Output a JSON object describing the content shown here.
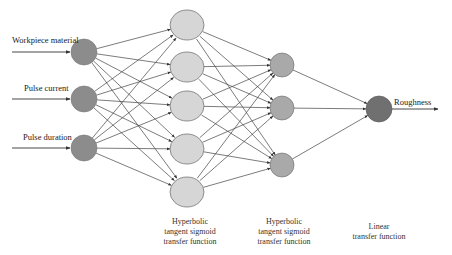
{
  "diagram": {
    "type": "neural-network",
    "colors": {
      "input_node": "#8c8c8c",
      "hidden1_node": "#d6d6d6",
      "hidden2_node": "#a9a9a9",
      "output_node": "#707070",
      "edge": "#444444",
      "node_stroke": "#666666"
    },
    "inputs": [
      {
        "label": "Workpiece material",
        "x": 84,
        "y": 52
      },
      {
        "label": "Pulse current",
        "x": 84,
        "y": 99
      },
      {
        "label": "Pulse duration",
        "x": 84,
        "y": 148
      }
    ],
    "hidden1": [
      {
        "x": 187,
        "y": 25
      },
      {
        "x": 187,
        "y": 67
      },
      {
        "x": 187,
        "y": 106
      },
      {
        "x": 187,
        "y": 149
      },
      {
        "x": 187,
        "y": 192
      }
    ],
    "hidden2": [
      {
        "x": 282,
        "y": 65
      },
      {
        "x": 282,
        "y": 108
      },
      {
        "x": 282,
        "y": 165
      }
    ],
    "output": {
      "label": "Roughness",
      "x": 379,
      "y": 109
    },
    "captions": {
      "hidden1": [
        "Hyperbolic",
        "tangent sigmoid",
        "transfer function"
      ],
      "hidden2": [
        "Hyperbolic",
        "tangent sigmoid",
        "transfer function"
      ],
      "output": [
        "Linear",
        "transfer function"
      ]
    }
  }
}
